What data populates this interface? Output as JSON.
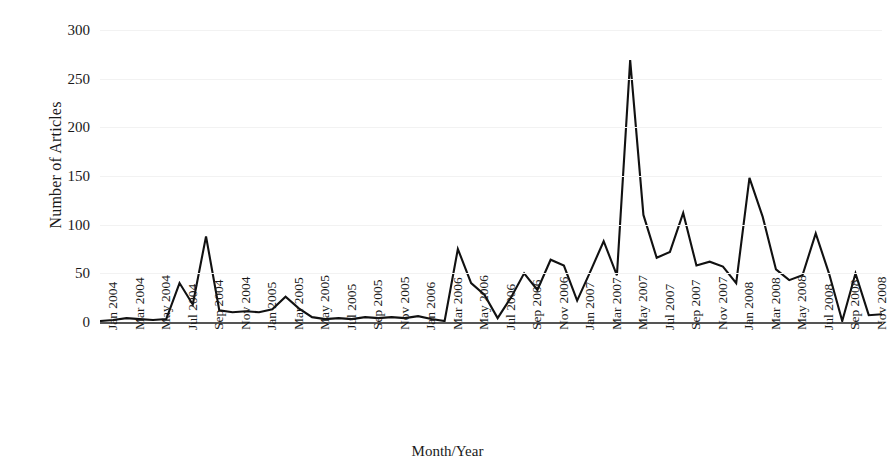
{
  "chart_data": {
    "type": "line",
    "title": "",
    "xlabel": "Month/Year",
    "ylabel": "Number of Articles",
    "ylim": [
      0,
      300
    ],
    "yticks": [
      0,
      50,
      100,
      150,
      200,
      250,
      300
    ],
    "grid": true,
    "legend": "none",
    "line_color": "#111111",
    "x": [
      "Jan 2004",
      "Feb 2004",
      "Mar 2004",
      "Apr 2004",
      "May 2004",
      "Jun 2004",
      "Jul 2004",
      "Aug 2004",
      "Sep 2004",
      "Oct 2004",
      "Nov 2004",
      "Dec 2004",
      "Jan 2005",
      "Feb 2005",
      "Mar 2005",
      "Apr 2005",
      "May 2005",
      "Jun 2005",
      "Jul 2005",
      "Aug 2005",
      "Sep 2005",
      "Oct 2005",
      "Nov 2005",
      "Dec 2005",
      "Jan 2006",
      "Feb 2006",
      "Mar 2006",
      "Apr 2006",
      "May 2006",
      "Jun 2006",
      "Jul 2006",
      "Aug 2006",
      "Sep 2006",
      "Oct 2006",
      "Nov 2006",
      "Dec 2006",
      "Jan 2007",
      "Feb 2007",
      "Mar 2007",
      "Apr 2007",
      "May 2007",
      "Jun 2007",
      "Jul 2007",
      "Aug 2007",
      "Sep 2007",
      "Oct 2007",
      "Nov 2007",
      "Dec 2007",
      "Jan 2008",
      "Feb 2008",
      "Mar 2008",
      "Apr 2008",
      "May 2008",
      "Jun 2008",
      "Jul 2008",
      "Aug 2008",
      "Sep 2008",
      "Oct 2008",
      "Nov 2008",
      "Dec 2008"
    ],
    "xtick_labels": [
      "Jan 2004",
      "Mar 2004",
      "May 2004",
      "Jul 2004",
      "Sep 2004",
      "Nov 2004",
      "Jan 2005",
      "Mar 2005",
      "May 2005",
      "Jul 2005",
      "Sep 2005",
      "Nov 2005",
      "Jan 2006",
      "Mar 2006",
      "May 2006",
      "Jul 2006",
      "Sep 2006",
      "Nov 2006",
      "Jan 2007",
      "Mar 2007",
      "May 2007",
      "Jul 2007",
      "Sep 2007",
      "Nov 2007",
      "Jan 2008",
      "Mar 2008",
      "May 2008",
      "Jul 2008",
      "Sep 2008",
      "Nov 2008"
    ],
    "xtick_indices": [
      0,
      2,
      4,
      6,
      8,
      10,
      12,
      14,
      16,
      18,
      20,
      22,
      24,
      26,
      28,
      30,
      32,
      34,
      36,
      38,
      40,
      42,
      44,
      46,
      48,
      50,
      52,
      54,
      56,
      58
    ],
    "values": [
      1,
      2,
      4,
      3,
      2,
      3,
      40,
      18,
      88,
      12,
      10,
      11,
      10,
      13,
      26,
      14,
      5,
      3,
      4,
      3,
      5,
      4,
      5,
      4,
      6,
      3,
      1,
      75,
      40,
      28,
      4,
      25,
      50,
      33,
      64,
      58,
      22,
      52,
      83,
      48,
      269,
      110,
      66,
      72,
      112,
      58,
      62,
      57,
      40,
      148,
      108,
      54,
      43,
      48,
      91,
      50,
      1,
      50,
      7,
      8
    ],
    "series": [
      {
        "name": "Number of Articles",
        "values": [
          1,
          2,
          4,
          3,
          2,
          3,
          40,
          18,
          88,
          12,
          10,
          11,
          10,
          13,
          26,
          14,
          5,
          3,
          4,
          3,
          5,
          4,
          5,
          4,
          6,
          3,
          1,
          75,
          40,
          28,
          4,
          25,
          50,
          33,
          64,
          58,
          22,
          52,
          83,
          48,
          269,
          110,
          66,
          72,
          112,
          58,
          62,
          57,
          40,
          148,
          108,
          54,
          43,
          48,
          91,
          50,
          1,
          50,
          7,
          8
        ]
      }
    ],
    "annotations": []
  }
}
